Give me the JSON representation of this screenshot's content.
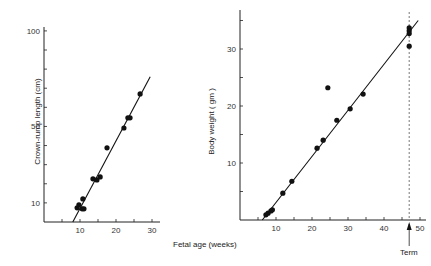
{
  "shared": {
    "xlabel": "Fetal age (weeks)",
    "term_label": "Term"
  },
  "chart_data": [
    {
      "type": "scatter",
      "title": "",
      "xlabel": "Fetal age (weeks)",
      "ylabel": "Crown-rump length (cm)",
      "xlim": [
        0,
        32
      ],
      "ylim": [
        0,
        100
      ],
      "xticks": [
        5,
        10,
        15,
        20,
        25,
        30
      ],
      "xtick_labels": [
        "10",
        "20",
        "30"
      ],
      "xtick_label_values": [
        10,
        20,
        30
      ],
      "yticks": [
        10,
        20,
        30,
        40,
        50,
        60,
        70,
        80,
        90,
        100
      ],
      "ytick_labels": [
        "10",
        "50",
        "100"
      ],
      "ytick_label_values": [
        10,
        50,
        100
      ],
      "grid": false,
      "points": [
        {
          "x": 9.2,
          "y": 7.4
        },
        {
          "x": 9.7,
          "y": 9.0
        },
        {
          "x": 10.6,
          "y": 6.9
        },
        {
          "x": 11.1,
          "y": 6.9
        },
        {
          "x": 10.8,
          "y": 12.1
        },
        {
          "x": 13.6,
          "y": 22.6
        },
        {
          "x": 14.7,
          "y": 22.0
        },
        {
          "x": 15.6,
          "y": 23.6
        },
        {
          "x": 17.5,
          "y": 38.8
        },
        {
          "x": 22.2,
          "y": 49.2
        },
        {
          "x": 23.3,
          "y": 54.5
        },
        {
          "x": 23.9,
          "y": 54.5
        },
        {
          "x": 26.7,
          "y": 67.0
        }
      ],
      "fit_line": {
        "x0": 8.0,
        "y0": 0,
        "x1": 29.5,
        "y1": 76
      }
    },
    {
      "type": "scatter",
      "title": "",
      "xlabel": "Fetal age (weeks)",
      "ylabel": "Body weight ( gm )",
      "xlim": [
        0,
        51
      ],
      "ylim": [
        0,
        37
      ],
      "xticks": [
        5,
        10,
        15,
        20,
        25,
        30,
        35,
        40,
        45,
        50
      ],
      "xtick_labels": [
        "10",
        "20",
        "30",
        "40",
        "50"
      ],
      "xtick_label_values": [
        10,
        20,
        30,
        40,
        50
      ],
      "yticks": [
        5,
        10,
        15,
        20,
        25,
        30,
        35
      ],
      "ytick_labels": [
        "10",
        "20",
        "30"
      ],
      "ytick_label_values": [
        10,
        20,
        30
      ],
      "grid": false,
      "points": [
        {
          "x": 7.2,
          "y": 0.9
        },
        {
          "x": 7.8,
          "y": 1.2
        },
        {
          "x": 8.6,
          "y": 1.6
        },
        {
          "x": 9.0,
          "y": 1.8
        },
        {
          "x": 11.9,
          "y": 4.7
        },
        {
          "x": 14.4,
          "y": 6.8
        },
        {
          "x": 21.4,
          "y": 12.6
        },
        {
          "x": 23.1,
          "y": 14.0
        },
        {
          "x": 24.4,
          "y": 23.2
        },
        {
          "x": 26.9,
          "y": 17.5
        },
        {
          "x": 30.6,
          "y": 19.5
        },
        {
          "x": 34.2,
          "y": 22.1
        },
        {
          "x": 47.0,
          "y": 33.7
        },
        {
          "x": 47.0,
          "y": 33.2
        },
        {
          "x": 47.0,
          "y": 32.7
        },
        {
          "x": 47.0,
          "y": 30.5
        }
      ],
      "fit_line": {
        "x0": 6.2,
        "y0": 0,
        "x1": 49.5,
        "y1": 35.0
      },
      "annotations": [
        {
          "type": "vline-dashed",
          "x": 47,
          "label": "Term",
          "arrow": "up"
        }
      ]
    }
  ]
}
